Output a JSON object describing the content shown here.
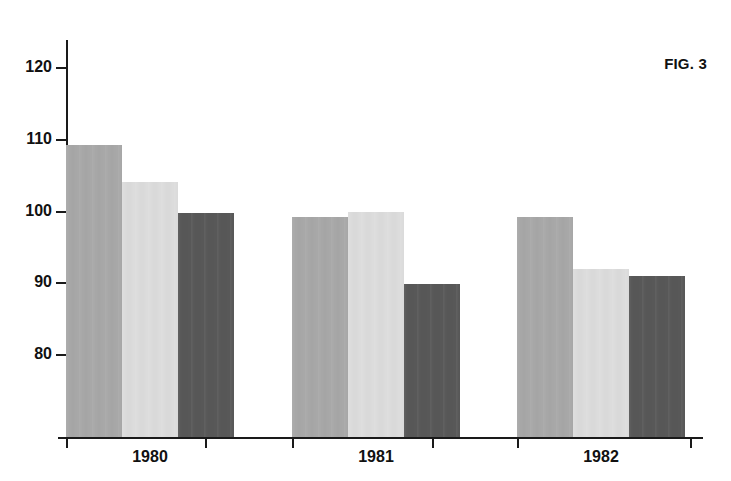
{
  "figure": {
    "label": "FIG. 3"
  },
  "chart_data": {
    "type": "bar",
    "title": "FIG. 3",
    "xlabel": "",
    "ylabel": "",
    "grid": false,
    "legend": "none",
    "categories": [
      "1980",
      "1981",
      "1982"
    ],
    "ylim": [
      68.6,
      124
    ],
    "yticks": [
      80,
      90,
      100,
      110,
      120
    ],
    "ytick_labels": [
      "80",
      "90",
      "100",
      "110",
      "120"
    ],
    "series": [
      {
        "name": "series-1",
        "color": "#a8a8a8",
        "values": [
          109.3,
          99.3,
          99.2
        ]
      },
      {
        "name": "series-2",
        "color": "#dcdcdc",
        "values": [
          104.2,
          99.9,
          92.0
        ]
      },
      {
        "name": "series-3",
        "color": "#585858",
        "values": [
          99.8,
          89.9,
          91.0
        ]
      }
    ]
  },
  "axes": {
    "y_ticks": [
      {
        "value": 120,
        "label": "120"
      },
      {
        "value": 110,
        "label": "110"
      },
      {
        "value": 100,
        "label": "100"
      },
      {
        "value": 90,
        "label": "90"
      },
      {
        "value": 80,
        "label": "80"
      }
    ],
    "x_groups": [
      {
        "label": "1980"
      },
      {
        "label": "1981"
      },
      {
        "label": "1982"
      }
    ]
  },
  "geometry": {
    "plot_left": 66,
    "plot_right": 703,
    "baseline_y": 437,
    "axis_top_y": 40,
    "y_value_at_baseline": 68.6,
    "pixels_per_unit": 7.175,
    "bar_width": 56,
    "groups": [
      {
        "start_x": 66,
        "label_center_x": 150
      },
      {
        "start_x": 292,
        "label_center_x": 376
      },
      {
        "start_x": 517,
        "label_center_x": 601
      }
    ],
    "x_tick_positions": [
      66,
      205,
      292,
      432,
      517,
      690
    ]
  }
}
